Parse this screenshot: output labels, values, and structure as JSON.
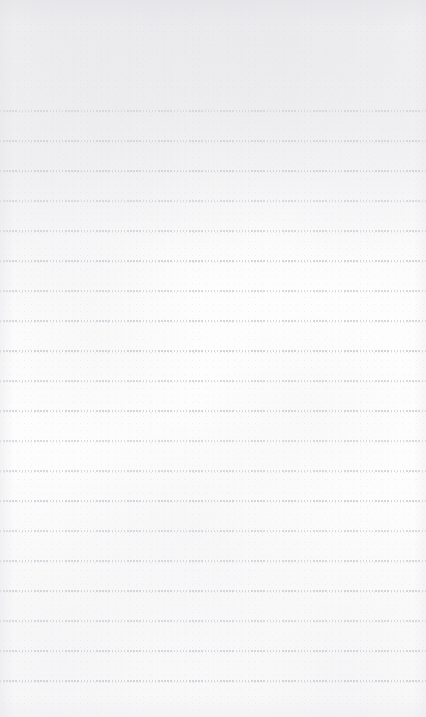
{
  "page": {
    "kind": "lined-paper-sheet",
    "width": 426,
    "height": 717,
    "background_color": "#fdfdfd",
    "has_text_content": false,
    "content_text": ""
  },
  "ruling": {
    "style": "dotted",
    "line_color": "#d4d4da",
    "line_count": 20,
    "first_line_y": 110,
    "line_spacing": 30,
    "dot_width": 1.5,
    "dot_pitch": 3.1,
    "line_thickness": 2,
    "starts_at_x": 0,
    "ends_at_x": 426,
    "line_y_positions": [
      110,
      140,
      170,
      200,
      230,
      260,
      290,
      320,
      350,
      380,
      410,
      440,
      470,
      500,
      530,
      560,
      590,
      620,
      650,
      680
    ]
  },
  "margins": {
    "top_blank_height": 110,
    "bottom_blank_height": 37,
    "left_blank_width": 0,
    "right_blank_width": 0
  },
  "texture": {
    "grain_color": "#e8e8ec",
    "speckle_color": "#cdcdd4",
    "edge_shade_color": "#e1e1e6"
  }
}
